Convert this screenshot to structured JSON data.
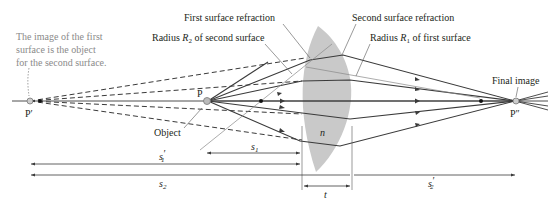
{
  "diagram": {
    "annotations": {
      "note_line1": "The image of the first",
      "note_line2": "surface is the object",
      "note_line3": "for the second surface.",
      "first_surface_refraction": "First surface refraction",
      "second_surface_refraction": "Second surface refraction",
      "radius_r2_prefix": "Radius ",
      "radius_r2_symbol": "R",
      "radius_r2_sub": "2",
      "radius_r2_suffix": " of second surface",
      "radius_r1_prefix": "Radius ",
      "radius_r1_symbol": "R",
      "radius_r1_sub": "1",
      "radius_r1_suffix": " of first surface",
      "final_image": "Final image",
      "object": "Object"
    },
    "points": {
      "p_prime": "P′",
      "p": "P",
      "p_double_prime": "P″"
    },
    "lens": {
      "index_label": "n",
      "fill_color": "#c9c9c9"
    },
    "distances": {
      "s1_prime": "s",
      "s1_prime_sub": "1",
      "s1_prime_mark": "′",
      "s1": "s",
      "s1_sub": "1",
      "s2": "s",
      "s2_sub": "2",
      "t": "t",
      "s2_prime": "s",
      "s2_prime_sub": "2",
      "s2_prime_mark": "′"
    },
    "colors": {
      "ray": "#3a3a3a",
      "dashed": "#3a3a3a",
      "note_text": "#8a8a8a",
      "text": "#231f20"
    }
  }
}
